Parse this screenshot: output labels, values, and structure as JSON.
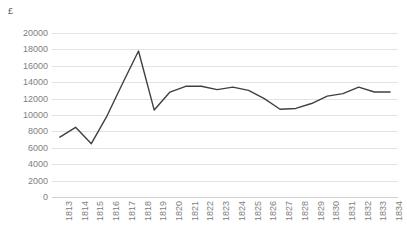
{
  "chart_data": {
    "type": "line",
    "title": "",
    "xlabel": "",
    "ylabel": "£",
    "y_unit_caption": "£",
    "categories": [
      "1813",
      "1814",
      "1815",
      "1816",
      "1817",
      "1818",
      "1819",
      "1820",
      "1821",
      "1822",
      "1823",
      "1824",
      "1825",
      "1826",
      "1827",
      "1828",
      "1829",
      "1830",
      "1831",
      "1832",
      "1833",
      "1834"
    ],
    "values": [
      7300,
      8500,
      6500,
      9900,
      13900,
      17800,
      10600,
      12800,
      13500,
      13500,
      13100,
      13400,
      13000,
      12000,
      10700,
      10800,
      11400,
      12300,
      12600,
      13400,
      12800,
      12800
    ],
    "series": [
      {
        "name": "",
        "values": [
          7300,
          8500,
          6500,
          9900,
          13900,
          17800,
          10600,
          12800,
          13500,
          13500,
          13100,
          13400,
          13000,
          12000,
          10700,
          10800,
          11400,
          12300,
          12600,
          13400,
          12800,
          12800
        ]
      }
    ],
    "ylim": [
      0,
      20000
    ],
    "ytick_step": 2000,
    "yticks": [
      20000,
      18000,
      16000,
      14000,
      12000,
      10000,
      8000,
      6000,
      4000,
      2000,
      0
    ],
    "ytick_labels": [
      "20000",
      "18000",
      "16000",
      "14000",
      "12000",
      "10000",
      "8000",
      "6000",
      "4000",
      "2000",
      "0"
    ],
    "grid": true,
    "grid_axis": "y",
    "legend": false,
    "legend_position": "none",
    "line_color": "#404040",
    "grid_color": "#e3e3e3",
    "tick_label_color": "#808080",
    "background_color": "#ffffff",
    "x_label_rotation": "-90"
  }
}
